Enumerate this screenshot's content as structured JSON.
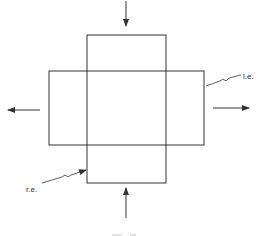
{
  "diagram": {
    "type": "technical-figure",
    "labels": {
      "left_edge": "l.e.",
      "right_edge": "r.e."
    },
    "arrows": [
      {
        "position": "top",
        "direction": "down"
      },
      {
        "position": "bottom",
        "direction": "up"
      },
      {
        "position": "left",
        "direction": "left"
      },
      {
        "position": "right",
        "direction": "right"
      }
    ],
    "colors": {
      "line": "#333333",
      "background": "#ffffff"
    }
  }
}
